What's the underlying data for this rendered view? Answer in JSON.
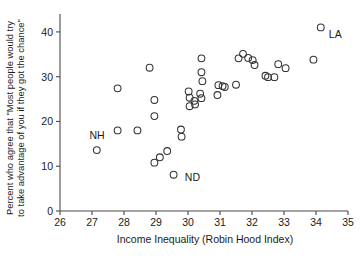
{
  "chart_data": {
    "type": "scatter",
    "title": "",
    "xlabel": "Income Inequality (Robin Hood Index)",
    "ylabel_line1": "Percent who agree that \"Most people would try",
    "ylabel_line2": "to take advantage of you if they got the chance\"",
    "xlim": [
      26,
      35
    ],
    "ylim": [
      0,
      44
    ],
    "xticks": [
      26,
      27,
      28,
      29,
      30,
      31,
      32,
      33,
      34,
      35
    ],
    "xtick_labels": [
      "26",
      "27",
      "28",
      "29",
      "30",
      "31",
      "32",
      "33",
      "34",
      "35"
    ],
    "yticks": [
      0,
      10,
      20,
      30,
      40
    ],
    "ytick_labels": [
      "0",
      "10",
      "20",
      "30",
      "40"
    ],
    "grid": false,
    "legend": false,
    "marker": "open-circle",
    "marker_color": "#333333",
    "points": [
      {
        "x": 27.15,
        "y": 13.6
      },
      {
        "x": 27.8,
        "y": 27.4
      },
      {
        "x": 27.8,
        "y": 18.0
      },
      {
        "x": 28.42,
        "y": 18.0
      },
      {
        "x": 28.8,
        "y": 32.0
      },
      {
        "x": 28.95,
        "y": 24.8
      },
      {
        "x": 28.95,
        "y": 21.2
      },
      {
        "x": 28.95,
        "y": 10.8
      },
      {
        "x": 29.12,
        "y": 12.0
      },
      {
        "x": 29.35,
        "y": 13.4
      },
      {
        "x": 29.55,
        "y": 8.1
      },
      {
        "x": 29.78,
        "y": 18.2
      },
      {
        "x": 29.8,
        "y": 16.6
      },
      {
        "x": 30.02,
        "y": 26.7
      },
      {
        "x": 30.05,
        "y": 25.3
      },
      {
        "x": 30.05,
        "y": 23.4
      },
      {
        "x": 30.2,
        "y": 24.6
      },
      {
        "x": 30.22,
        "y": 23.8
      },
      {
        "x": 30.38,
        "y": 26.2
      },
      {
        "x": 30.42,
        "y": 25.2
      },
      {
        "x": 30.42,
        "y": 34.1
      },
      {
        "x": 30.42,
        "y": 31.0
      },
      {
        "x": 30.45,
        "y": 29.0
      },
      {
        "x": 30.92,
        "y": 25.9
      },
      {
        "x": 30.95,
        "y": 28.1
      },
      {
        "x": 31.08,
        "y": 27.9
      },
      {
        "x": 31.15,
        "y": 27.7
      },
      {
        "x": 31.5,
        "y": 28.2
      },
      {
        "x": 31.58,
        "y": 34.1
      },
      {
        "x": 31.72,
        "y": 35.1
      },
      {
        "x": 31.88,
        "y": 34.2
      },
      {
        "x": 32.02,
        "y": 33.7
      },
      {
        "x": 32.08,
        "y": 32.6
      },
      {
        "x": 32.42,
        "y": 30.2
      },
      {
        "x": 32.5,
        "y": 29.9
      },
      {
        "x": 32.7,
        "y": 29.9
      },
      {
        "x": 32.82,
        "y": 32.8
      },
      {
        "x": 33.05,
        "y": 31.9
      },
      {
        "x": 33.92,
        "y": 33.8
      },
      {
        "x": 34.15,
        "y": 41.0
      }
    ],
    "annotations": [
      {
        "label": "NH",
        "x": 26.92,
        "y": 16.0
      },
      {
        "label": "ND",
        "x": 29.9,
        "y": 6.6
      },
      {
        "label": "LA",
        "x": 34.4,
        "y": 38.6
      }
    ]
  }
}
